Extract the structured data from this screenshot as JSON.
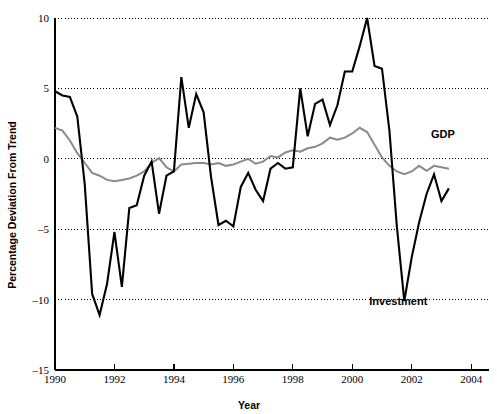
{
  "chart_data": {
    "type": "line",
    "title": "",
    "xlabel": "Year",
    "ylabel": "Percentage Deviation From Trend",
    "xlim": [
      1990,
      2004.6
    ],
    "ylim": [
      -15,
      10
    ],
    "xticks": [
      1990,
      1992,
      1994,
      1996,
      1998,
      2000,
      2002,
      2004
    ],
    "xtick_labels": [
      "1990",
      "1992",
      "1994",
      "1996",
      "1998",
      "2000",
      "2002",
      "2004"
    ],
    "yticks": [
      -15,
      -10,
      -5,
      0,
      5,
      10
    ],
    "ytick_labels": [
      "–15",
      "–10",
      "–5",
      "0",
      "5",
      "10"
    ],
    "grid": "horizontal-dotted",
    "gridlines": [
      10,
      5,
      0,
      -5,
      -10
    ],
    "legend_position": "inline-annotations",
    "series": [
      {
        "name": "Investment",
        "color": "#000000",
        "linewidth": 2.1,
        "label_x": 2001.55,
        "label_y": -10.4,
        "x": [
          1990.0,
          1990.25,
          1990.5,
          1990.75,
          1991.0,
          1991.25,
          1991.5,
          1991.75,
          1992.0,
          1992.25,
          1992.5,
          1992.75,
          1993.0,
          1993.25,
          1993.5,
          1993.75,
          1994.0,
          1994.25,
          1994.5,
          1994.75,
          1995.0,
          1995.25,
          1995.5,
          1995.75,
          1996.0,
          1996.25,
          1996.5,
          1996.75,
          1997.0,
          1997.25,
          1997.5,
          1997.75,
          1998.0,
          1998.25,
          1998.5,
          1998.75,
          1999.0,
          1999.25,
          1999.5,
          1999.75,
          2000.0,
          2000.25,
          2000.5,
          2000.75,
          2001.0,
          2001.25,
          2001.5,
          2001.75,
          2002.0,
          2002.25,
          2002.5,
          2002.75,
          2003.0,
          2003.25
        ],
        "values": [
          4.8,
          4.5,
          4.4,
          3.0,
          -1.8,
          -9.6,
          -11.1,
          -8.9,
          -5.2,
          -9.1,
          -3.5,
          -3.3,
          -1.2,
          -0.2,
          -3.9,
          -1.2,
          -0.9,
          5.8,
          2.2,
          4.6,
          3.3,
          -1.3,
          -4.7,
          -4.4,
          -4.8,
          -2.0,
          -1.0,
          -2.2,
          -3.0,
          -0.7,
          -0.3,
          -0.7,
          -0.6,
          5.0,
          1.6,
          3.9,
          4.2,
          2.4,
          3.8,
          6.2,
          6.2,
          8.0,
          10.0,
          6.6,
          6.4,
          2.0,
          -4.8,
          -10.1,
          -7.0,
          -4.5,
          -2.5,
          -1.1,
          -3.0,
          -2.1
        ]
      },
      {
        "name": "GDP",
        "color": "#8a8a8a",
        "linewidth": 2.0,
        "label_x": 2003.05,
        "label_y": 1.45,
        "x": [
          1990.0,
          1990.25,
          1990.5,
          1990.75,
          1991.0,
          1991.25,
          1991.5,
          1991.75,
          1992.0,
          1992.25,
          1992.5,
          1992.75,
          1993.0,
          1993.25,
          1993.5,
          1993.75,
          1994.0,
          1994.25,
          1994.5,
          1994.75,
          1995.0,
          1995.25,
          1995.5,
          1995.75,
          1996.0,
          1996.25,
          1996.5,
          1996.75,
          1997.0,
          1997.25,
          1997.5,
          1997.75,
          1998.0,
          1998.25,
          1998.5,
          1998.75,
          1999.0,
          1999.25,
          1999.5,
          1999.75,
          2000.0,
          2000.25,
          2000.5,
          2000.75,
          2001.0,
          2001.25,
          2001.5,
          2001.75,
          2002.0,
          2002.25,
          2002.5,
          2002.75,
          2003.0,
          2003.25
        ],
        "values": [
          2.2,
          2.0,
          1.3,
          0.4,
          -0.3,
          -1.0,
          -1.2,
          -1.5,
          -1.6,
          -1.5,
          -1.4,
          -1.2,
          -0.9,
          -0.3,
          0.05,
          -0.6,
          -0.9,
          -0.4,
          -0.35,
          -0.3,
          -0.3,
          -0.4,
          -0.3,
          -0.5,
          -0.4,
          -0.2,
          0.0,
          -0.35,
          -0.2,
          0.2,
          0.1,
          0.45,
          0.6,
          0.5,
          0.75,
          0.85,
          1.1,
          1.5,
          1.35,
          1.5,
          1.8,
          2.2,
          1.9,
          1.0,
          0.1,
          -0.5,
          -0.9,
          -1.1,
          -0.9,
          -0.5,
          -0.85,
          -0.5,
          -0.6,
          -0.7
        ]
      }
    ]
  }
}
